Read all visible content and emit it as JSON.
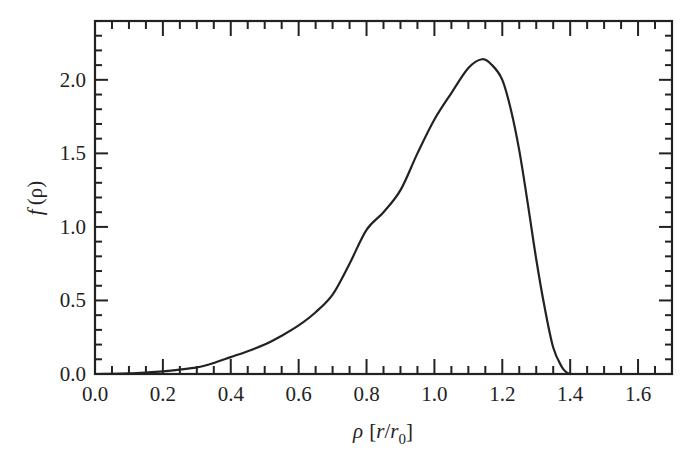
{
  "chart_data": {
    "type": "line",
    "title": "",
    "xlabel": "ρ [r/r0]",
    "xlabel_parts": {
      "symbol": "ρ",
      "bracket_open": "[",
      "r": "r",
      "slash": "/",
      "r0": "r",
      "r0_sub": "0",
      "bracket_close": "]"
    },
    "ylabel": "f (ρ)",
    "ylabel_parts": {
      "f": "f",
      "paren": "(ρ)"
    },
    "xlim": [
      0.0,
      1.7
    ],
    "ylim": [
      0.0,
      2.4
    ],
    "grid": false,
    "legend": null,
    "x_ticks": [
      0.0,
      0.2,
      0.4,
      0.6,
      0.8,
      1.0,
      1.2,
      1.4,
      1.6
    ],
    "x_tick_labels": [
      "0.0",
      "0.2",
      "0.4",
      "0.6",
      "0.8",
      "1.0",
      "1.2",
      "1.4",
      "1.6"
    ],
    "x_minor_step": 0.05,
    "y_ticks": [
      0.0,
      0.5,
      1.0,
      1.5,
      2.0
    ],
    "y_tick_labels": [
      "0.0",
      "0.5",
      "1.0",
      "1.5",
      "2.0"
    ],
    "y_minor_step": 0.1,
    "series": [
      {
        "name": "f(ρ)",
        "color": "#222222",
        "x": [
          0.0,
          0.05,
          0.1,
          0.15,
          0.2,
          0.25,
          0.3,
          0.35,
          0.4,
          0.45,
          0.5,
          0.55,
          0.6,
          0.65,
          0.7,
          0.75,
          0.8,
          0.85,
          0.9,
          0.95,
          1.0,
          1.05,
          1.1,
          1.14,
          1.17,
          1.2,
          1.225,
          1.25,
          1.275,
          1.3,
          1.325,
          1.35,
          1.375,
          1.39,
          1.4
        ],
        "y": [
          0.0,
          0.001,
          0.004,
          0.01,
          0.018,
          0.03,
          0.045,
          0.075,
          0.115,
          0.155,
          0.2,
          0.26,
          0.33,
          0.42,
          0.54,
          0.75,
          0.98,
          1.1,
          1.25,
          1.5,
          1.73,
          1.91,
          2.08,
          2.14,
          2.1,
          2.0,
          1.8,
          1.52,
          1.16,
          0.78,
          0.45,
          0.18,
          0.05,
          0.01,
          0.0
        ]
      }
    ]
  }
}
